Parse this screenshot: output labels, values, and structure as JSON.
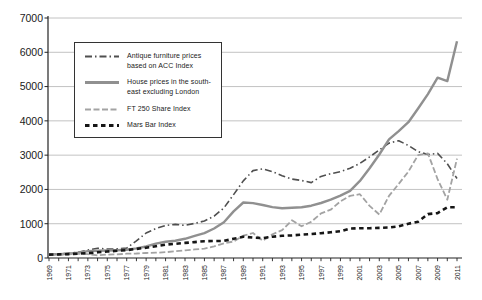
{
  "chart_data": {
    "type": "line",
    "title": "",
    "xlabel": "",
    "ylabel": "",
    "x_range": [
      1969,
      2011
    ],
    "x_tick_step": 1,
    "x_label_step": 2,
    "x_tick_labels": [
      "1969",
      "1971",
      "1973",
      "1975",
      "1977",
      "1979",
      "1981",
      "1983",
      "1985",
      "1987",
      "1989",
      "1991",
      "1993",
      "1995",
      "1997",
      "1999",
      "2001",
      "2003",
      "2005",
      "2007",
      "2009",
      "2011"
    ],
    "ylim": [
      0,
      7000
    ],
    "y_tick_step": 1000,
    "y_tick_labels": [
      "0",
      "1000",
      "2000",
      "3000",
      "4000",
      "5000",
      "6000",
      "7000"
    ],
    "grid": true,
    "legend_position": "top-left-inside",
    "colors": {
      "axis": "#222222",
      "grid": "#b3b3b3",
      "text": "#1a1a1a",
      "background": "#ffffff"
    },
    "series": [
      {
        "id": "antique-furniture",
        "name": "Antique furniture prices based on ACC Index",
        "color": "#4f4f4f",
        "dash": "7 3 1.5 3",
        "width": 1.6,
        "points": [
          [
            1969,
            100
          ],
          [
            1970,
            115
          ],
          [
            1971,
            140
          ],
          [
            1972,
            170
          ],
          [
            1973,
            230
          ],
          [
            1974,
            285
          ],
          [
            1975,
            260
          ],
          [
            1976,
            265
          ],
          [
            1977,
            290
          ],
          [
            1978,
            500
          ],
          [
            1979,
            730
          ],
          [
            1980,
            860
          ],
          [
            1981,
            950
          ],
          [
            1982,
            980
          ],
          [
            1983,
            950
          ],
          [
            1984,
            1010
          ],
          [
            1985,
            1080
          ],
          [
            1986,
            1220
          ],
          [
            1987,
            1460
          ],
          [
            1988,
            1850
          ],
          [
            1989,
            2250
          ],
          [
            1990,
            2550
          ],
          [
            1991,
            2600
          ],
          [
            1992,
            2520
          ],
          [
            1993,
            2400
          ],
          [
            1994,
            2300
          ],
          [
            1995,
            2260
          ],
          [
            1996,
            2200
          ],
          [
            1997,
            2380
          ],
          [
            1998,
            2460
          ],
          [
            1999,
            2520
          ],
          [
            2000,
            2620
          ],
          [
            2001,
            2760
          ],
          [
            2002,
            2950
          ],
          [
            2003,
            3150
          ],
          [
            2004,
            3350
          ],
          [
            2005,
            3420
          ],
          [
            2006,
            3280
          ],
          [
            2007,
            3100
          ],
          [
            2008,
            3020
          ],
          [
            2009,
            3050
          ],
          [
            2010,
            2750
          ],
          [
            2011,
            2320
          ]
        ]
      },
      {
        "id": "house-prices",
        "name": "House prices in the south-east excluding London",
        "color": "#909090",
        "dash": "",
        "width": 2.4,
        "points": [
          [
            1969,
            100
          ],
          [
            1970,
            108
          ],
          [
            1971,
            122
          ],
          [
            1972,
            155
          ],
          [
            1973,
            200
          ],
          [
            1974,
            212
          ],
          [
            1975,
            218
          ],
          [
            1976,
            228
          ],
          [
            1977,
            242
          ],
          [
            1978,
            280
          ],
          [
            1979,
            335
          ],
          [
            1980,
            420
          ],
          [
            1981,
            475
          ],
          [
            1982,
            505
          ],
          [
            1983,
            560
          ],
          [
            1984,
            645
          ],
          [
            1985,
            725
          ],
          [
            1986,
            860
          ],
          [
            1987,
            1040
          ],
          [
            1988,
            1360
          ],
          [
            1989,
            1620
          ],
          [
            1990,
            1600
          ],
          [
            1991,
            1545
          ],
          [
            1992,
            1485
          ],
          [
            1993,
            1450
          ],
          [
            1994,
            1465
          ],
          [
            1995,
            1480
          ],
          [
            1996,
            1525
          ],
          [
            1997,
            1605
          ],
          [
            1998,
            1700
          ],
          [
            1999,
            1820
          ],
          [
            2000,
            1960
          ],
          [
            2001,
            2250
          ],
          [
            2002,
            2620
          ],
          [
            2003,
            3020
          ],
          [
            2004,
            3460
          ],
          [
            2005,
            3700
          ],
          [
            2006,
            3960
          ],
          [
            2007,
            4360
          ],
          [
            2008,
            4780
          ],
          [
            2009,
            5260
          ],
          [
            2010,
            5160
          ],
          [
            2011,
            6320
          ]
        ]
      },
      {
        "id": "ft-250-share",
        "name": "FT 250 Share Index",
        "color": "#a3a3a3",
        "dash": "6 2.5",
        "width": 1.8,
        "points": [
          [
            1969,
            100
          ],
          [
            1970,
            95
          ],
          [
            1971,
            108
          ],
          [
            1972,
            125
          ],
          [
            1973,
            110
          ],
          [
            1974,
            75
          ],
          [
            1975,
            100
          ],
          [
            1976,
            105
          ],
          [
            1977,
            125
          ],
          [
            1978,
            130
          ],
          [
            1979,
            145
          ],
          [
            1980,
            155
          ],
          [
            1981,
            170
          ],
          [
            1982,
            195
          ],
          [
            1983,
            225
          ],
          [
            1984,
            250
          ],
          [
            1985,
            275
          ],
          [
            1986,
            340
          ],
          [
            1987,
            430
          ],
          [
            1988,
            480
          ],
          [
            1989,
            650
          ],
          [
            1990,
            730
          ],
          [
            1991,
            505
          ],
          [
            1992,
            690
          ],
          [
            1993,
            810
          ],
          [
            1994,
            1100
          ],
          [
            1995,
            925
          ],
          [
            1996,
            1060
          ],
          [
            1997,
            1300
          ],
          [
            1998,
            1410
          ],
          [
            1999,
            1650
          ],
          [
            2000,
            1810
          ],
          [
            2001,
            1860
          ],
          [
            2002,
            1520
          ],
          [
            2003,
            1270
          ],
          [
            2004,
            1810
          ],
          [
            2005,
            2160
          ],
          [
            2006,
            2520
          ],
          [
            2007,
            3000
          ],
          [
            2008,
            3050
          ],
          [
            2009,
            2300
          ],
          [
            2010,
            1700
          ],
          [
            2011,
            2900
          ]
        ]
      },
      {
        "id": "mars-bar",
        "name": "Mars Bar Index",
        "color": "#161616",
        "dash": "4.5 3.5",
        "width": 2.6,
        "points": [
          [
            1969,
            100
          ],
          [
            1970,
            105
          ],
          [
            1971,
            115
          ],
          [
            1972,
            125
          ],
          [
            1973,
            140
          ],
          [
            1974,
            165
          ],
          [
            1975,
            190
          ],
          [
            1976,
            210
          ],
          [
            1977,
            230
          ],
          [
            1978,
            265
          ],
          [
            1979,
            300
          ],
          [
            1980,
            345
          ],
          [
            1981,
            390
          ],
          [
            1982,
            415
          ],
          [
            1983,
            440
          ],
          [
            1984,
            465
          ],
          [
            1985,
            490
          ],
          [
            1986,
            495
          ],
          [
            1987,
            500
          ],
          [
            1988,
            560
          ],
          [
            1989,
            620
          ],
          [
            1990,
            595
          ],
          [
            1991,
            580
          ],
          [
            1992,
            620
          ],
          [
            1993,
            648
          ],
          [
            1994,
            660
          ],
          [
            1995,
            680
          ],
          [
            1996,
            700
          ],
          [
            1997,
            722
          ],
          [
            1998,
            750
          ],
          [
            1999,
            782
          ],
          [
            2000,
            860
          ],
          [
            2001,
            868
          ],
          [
            2002,
            870
          ],
          [
            2003,
            878
          ],
          [
            2004,
            890
          ],
          [
            2005,
            925
          ],
          [
            2006,
            1000
          ],
          [
            2007,
            1060
          ],
          [
            2008,
            1280
          ],
          [
            2009,
            1310
          ],
          [
            2010,
            1480
          ],
          [
            2011,
            1480
          ]
        ]
      }
    ]
  }
}
